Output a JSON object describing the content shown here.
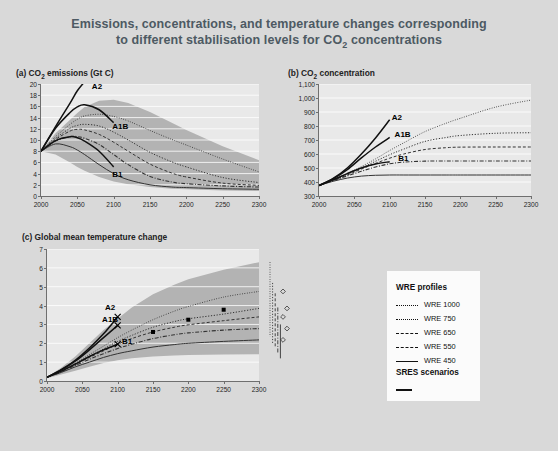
{
  "figure": {
    "title_line1": "Emissions, concentrations, and temperature changes corresponding",
    "title_line2_pre": "to different stabilisation levels for CO",
    "title_line2_sub": "2",
    "title_line2_post": " concentrations",
    "background_color": "#d9d9d9",
    "plot_background_color": "#e9e9e9",
    "band_color": "#b3b3b3",
    "axis_color": "#6f6f6f",
    "title_color": "#4d5a63"
  },
  "legend": {
    "wre_heading": "WRE profiles",
    "sres_heading": "SRES scenarios",
    "wre_items": [
      {
        "label": "WRE 1000",
        "style": "fine-dotted"
      },
      {
        "label": "WRE 750",
        "style": "dotted"
      },
      {
        "label": "WRE 650",
        "style": "dashed"
      },
      {
        "label": "WRE 550",
        "style": "dash-dot"
      },
      {
        "label": "WRE 450",
        "style": "solid"
      }
    ],
    "sres_item": {
      "label": "",
      "style": "solid-thick"
    }
  },
  "chart_data": [
    {
      "type": "line",
      "panel": "a",
      "title_pre": "(a) CO",
      "title_sub": "2",
      "title_post": " emissions (Gt C)",
      "xlabel": "",
      "ylabel": "Gt C",
      "xlim": [
        2000,
        2300
      ],
      "ylim": [
        0,
        20
      ],
      "xticks": [
        2000,
        2050,
        2100,
        2150,
        2200,
        2250,
        2300
      ],
      "yticks": [
        0,
        2,
        4,
        6,
        8,
        10,
        12,
        14,
        16,
        18,
        20
      ],
      "ytick_labels": [
        "0",
        "2",
        "4",
        "6",
        "8",
        "10",
        "12",
        "14",
        "16",
        "18",
        "20"
      ],
      "grid": true,
      "x": [
        2000,
        2020,
        2040,
        2050,
        2060,
        2080,
        2100,
        2120,
        2150,
        2180,
        2200,
        2250,
        2300
      ],
      "band_upper": [
        8.0,
        11.2,
        13.6,
        14.8,
        15.9,
        17.0,
        17.2,
        16.6,
        15.0,
        13.1,
        11.8,
        8.9,
        6.4
      ],
      "band_lower": [
        8.0,
        7.4,
        6.0,
        5.2,
        4.5,
        3.4,
        2.6,
        2.1,
        1.6,
        1.3,
        1.2,
        1.0,
        0.9
      ],
      "series": [
        {
          "name": "WRE 1000",
          "style": "fine-dotted",
          "values": [
            8.0,
            10.6,
            12.8,
            13.7,
            14.3,
            14.6,
            14.2,
            13.4,
            11.7,
            10.1,
            9.1,
            6.6,
            4.3
          ]
        },
        {
          "name": "WRE 750",
          "style": "dotted",
          "values": [
            8.0,
            10.3,
            12.1,
            12.6,
            12.8,
            12.5,
            11.4,
            10.0,
            7.8,
            6.1,
            5.2,
            3.3,
            2.4
          ]
        },
        {
          "name": "WRE 650",
          "style": "dashed",
          "values": [
            8.0,
            10.1,
            11.6,
            11.9,
            11.8,
            11.0,
            9.6,
            8.0,
            5.7,
            4.1,
            3.4,
            2.3,
            1.9
          ]
        },
        {
          "name": "WRE 550",
          "style": "dash-dot",
          "values": [
            8.0,
            9.8,
            10.6,
            10.6,
            10.3,
            9.2,
            7.4,
            5.6,
            3.5,
            2.5,
            2.2,
            1.8,
            1.6
          ]
        },
        {
          "name": "WRE 450",
          "style": "solid",
          "values": [
            8.0,
            9.3,
            8.8,
            8.2,
            7.4,
            5.6,
            4.0,
            2.9,
            2.0,
            1.6,
            1.5,
            1.3,
            1.2
          ]
        },
        {
          "name": "A2",
          "style": "sres-solid",
          "values": [
            8.0,
            12.4,
            16.6,
            18.8,
            20.4
          ]
        },
        {
          "name": "A1B",
          "style": "sres-solid",
          "values": [
            8.0,
            12.1,
            14.9,
            15.9,
            16.3,
            15.4,
            13.1
          ]
        },
        {
          "name": "B1",
          "style": "sres-solid",
          "values": [
            8.0,
            9.9,
            10.6,
            10.4,
            9.8,
            8.0,
            5.2
          ]
        }
      ],
      "annotations": [
        {
          "text": "A2",
          "x": 2070,
          "y": 19.4
        },
        {
          "text": "A1B",
          "x": 2098,
          "y": 12.3
        },
        {
          "text": "B1",
          "x": 2098,
          "y": 3.7
        }
      ]
    },
    {
      "type": "line",
      "panel": "b",
      "title_pre": "(b) CO",
      "title_sub": "2",
      "title_post": " concentration",
      "xlabel": "",
      "ylabel": "ppm",
      "xlim": [
        2000,
        2300
      ],
      "ylim": [
        300,
        1100
      ],
      "xticks": [
        2000,
        2050,
        2100,
        2150,
        2200,
        2250,
        2300
      ],
      "yticks": [
        300,
        400,
        500,
        600,
        700,
        800,
        900,
        1000,
        1100
      ],
      "ytick_labels": [
        "300",
        "400",
        "500",
        "600",
        "700",
        "800",
        "900",
        "1,000",
        "1,100"
      ],
      "grid": true,
      "x": [
        2000,
        2020,
        2040,
        2060,
        2080,
        2100,
        2120,
        2150,
        2180,
        2200,
        2250,
        2300
      ],
      "series": [
        {
          "name": "WRE 1000",
          "style": "fine-dotted",
          "values": [
            375,
            415,
            460,
            510,
            565,
            625,
            680,
            760,
            820,
            855,
            935,
            985
          ]
        },
        {
          "name": "WRE 750",
          "style": "dotted",
          "values": [
            375,
            413,
            455,
            500,
            548,
            595,
            635,
            690,
            718,
            732,
            748,
            752
          ]
        },
        {
          "name": "WRE 650",
          "style": "dashed",
          "values": [
            375,
            412,
            450,
            492,
            533,
            570,
            600,
            632,
            645,
            649,
            650,
            650
          ]
        },
        {
          "name": "WRE 550",
          "style": "dash-dot",
          "values": [
            375,
            410,
            443,
            477,
            507,
            530,
            542,
            549,
            550,
            550,
            550,
            550
          ]
        },
        {
          "name": "WRE 450",
          "style": "solid",
          "values": [
            375,
            405,
            428,
            442,
            448,
            450,
            450,
            450,
            450,
            450,
            450,
            450
          ]
        },
        {
          "name": "A2",
          "style": "sres-solid",
          "values": [
            375,
            425,
            500,
            600,
            715,
            845
          ]
        },
        {
          "name": "A1B",
          "style": "sres-solid",
          "values": [
            375,
            422,
            488,
            572,
            650,
            718
          ]
        },
        {
          "name": "B1",
          "style": "sres-solid",
          "values": [
            375,
            415,
            460,
            500,
            528,
            545
          ]
        }
      ],
      "annotations": [
        {
          "text": "A2",
          "x": 2103,
          "y": 855
        },
        {
          "text": "A1B",
          "x": 2107,
          "y": 737
        },
        {
          "text": "B1",
          "x": 2112,
          "y": 565
        }
      ]
    },
    {
      "type": "line",
      "panel": "c",
      "title_pre": "(c) Global mean temperature change",
      "title_sub": "",
      "title_post": "",
      "xlabel": "",
      "ylabel": "°C",
      "xlim": [
        2000,
        2300
      ],
      "ylim": [
        0,
        7
      ],
      "xticks": [
        2000,
        2050,
        2100,
        2150,
        2200,
        2250,
        2300
      ],
      "yticks": [
        0,
        1,
        2,
        3,
        4,
        5,
        6,
        7
      ],
      "ytick_labels": [
        "0",
        "1",
        "2",
        "3",
        "4",
        "5",
        "6",
        "7"
      ],
      "grid": true,
      "x": [
        2000,
        2020,
        2040,
        2060,
        2080,
        2100,
        2120,
        2150,
        2180,
        2200,
        2250,
        2300
      ],
      "band_upper": [
        0.2,
        0.7,
        1.3,
        2.0,
        2.7,
        3.3,
        3.9,
        4.6,
        5.1,
        5.4,
        5.9,
        6.3
      ],
      "band_lower": [
        0.15,
        0.35,
        0.55,
        0.75,
        0.95,
        1.1,
        1.2,
        1.3,
        1.35,
        1.38,
        1.4,
        1.42
      ],
      "series": [
        {
          "name": "WRE 1000",
          "style": "fine-dotted",
          "values": [
            0.2,
            0.55,
            0.95,
            1.4,
            1.85,
            2.3,
            2.7,
            3.25,
            3.7,
            3.95,
            4.45,
            4.75
          ]
        },
        {
          "name": "WRE 750",
          "style": "dotted",
          "values": [
            0.2,
            0.52,
            0.9,
            1.3,
            1.7,
            2.1,
            2.42,
            2.85,
            3.15,
            3.3,
            3.55,
            3.85
          ]
        },
        {
          "name": "WRE 650",
          "style": "dashed",
          "values": [
            0.2,
            0.5,
            0.88,
            1.25,
            1.6,
            1.95,
            2.25,
            2.6,
            2.85,
            2.98,
            3.2,
            3.4
          ]
        },
        {
          "name": "WRE 550",
          "style": "dash-dot",
          "values": [
            0.2,
            0.48,
            0.82,
            1.15,
            1.45,
            1.72,
            1.95,
            2.25,
            2.45,
            2.55,
            2.7,
            2.78
          ]
        },
        {
          "name": "WRE 450",
          "style": "solid",
          "values": [
            0.2,
            0.45,
            0.75,
            1.0,
            1.25,
            1.45,
            1.6,
            1.8,
            1.93,
            2.0,
            2.1,
            2.18
          ]
        },
        {
          "name": "A2",
          "style": "sres-solid",
          "values": [
            0.2,
            0.6,
            1.1,
            1.75,
            2.5,
            3.4
          ]
        },
        {
          "name": "A1B",
          "style": "sres-solid",
          "values": [
            0.2,
            0.58,
            1.05,
            1.65,
            2.3,
            2.95
          ]
        },
        {
          "name": "B1",
          "style": "sres-solid",
          "values": [
            0.2,
            0.52,
            0.9,
            1.3,
            1.65,
            1.95
          ]
        }
      ],
      "markers": [
        {
          "x": 2150,
          "y": 2.6
        },
        {
          "x": 2200,
          "y": 3.25
        },
        {
          "x": 2250,
          "y": 3.78
        }
      ],
      "annotations": [
        {
          "text": "A2",
          "x": 2082,
          "y": 3.85
        },
        {
          "text": "A1B",
          "x": 2078,
          "y": 3.25
        },
        {
          "text": "B1",
          "x": 2106,
          "y": 2.05
        }
      ],
      "side_ranges": [
        {
          "style": "fine-dotted",
          "low": 2.35,
          "high": 6.3,
          "marker": 4.75
        },
        {
          "style": "dotted",
          "low": 1.95,
          "high": 5.2,
          "marker": 3.85
        },
        {
          "style": "dashed",
          "low": 1.75,
          "high": 4.65,
          "marker": 3.4
        },
        {
          "style": "dash-dot",
          "low": 1.5,
          "high": 3.9,
          "marker": 2.78
        },
        {
          "style": "solid",
          "low": 1.2,
          "high": 3.0,
          "marker": 2.18
        }
      ]
    }
  ]
}
